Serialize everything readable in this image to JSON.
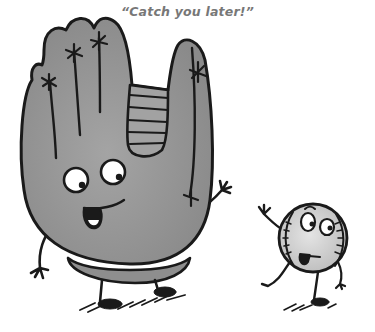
{
  "illustration": {
    "caption": "“Catch you later!”",
    "characters": [
      {
        "name": "baseball-glove",
        "description": "Gray baseball mitt character with googly eyes, open mouth, waving arm"
      },
      {
        "name": "baseball",
        "description": "Small baseball character with stitches, waving goodbye while walking"
      }
    ],
    "colors": {
      "glove_fill": "#9a9a9a",
      "glove_shade": "#8c8c8c",
      "ball_fill": "#d6d6d6",
      "outline": "#1a1a1a",
      "caption_text": "#777777",
      "background": "#ffffff"
    }
  }
}
